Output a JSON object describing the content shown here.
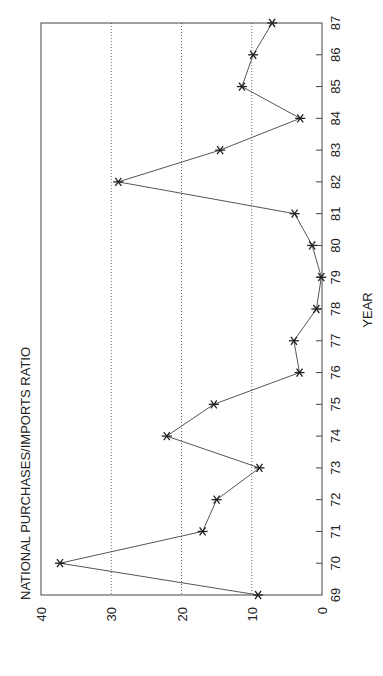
{
  "chart_data": {
    "type": "line",
    "orientation": "rotated-90-ccw",
    "title": "NATIONAL PURCHASES/IMPORTS RATIO",
    "xlabel": "YEAR",
    "ylabel": "",
    "x": [
      "69",
      "70",
      "71",
      "72",
      "73",
      "74",
      "75",
      "76",
      "77",
      "78",
      "79",
      "80",
      "81",
      "82",
      "83",
      "84",
      "85",
      "86",
      "87"
    ],
    "series": [
      {
        "name": "National Purchases/Imports Ratio",
        "marker": "asterisk",
        "values": [
          9.1,
          37.3,
          17.0,
          15.0,
          8.9,
          22.1,
          15.4,
          3.2,
          4.0,
          0.8,
          0.1,
          1.4,
          3.9,
          29.0,
          14.5,
          3.1,
          11.4,
          9.8,
          7.1
        ]
      }
    ],
    "yticks": [
      "0",
      "10",
      "20",
      "30",
      "40"
    ],
    "ylim": [
      0,
      40
    ],
    "grid": {
      "horizontal_dotted_at": [
        10,
        20,
        30
      ]
    },
    "legend": "none"
  },
  "colors": {
    "line": "#555555",
    "marker": "#222222",
    "frame": "#444444",
    "grid": "#666666",
    "text": "#222222"
  }
}
